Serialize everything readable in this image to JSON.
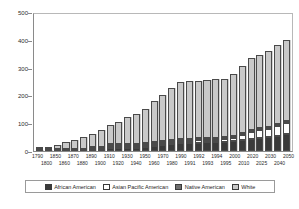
{
  "chart_data": {
    "type": "bar",
    "stacked": true,
    "title": "",
    "subtitle": "",
    "xlabel": "",
    "ylabel": "",
    "ylim": [
      0,
      500
    ],
    "yticks": [
      0,
      100,
      200,
      300,
      400,
      500
    ],
    "ytick_labels": [
      "0",
      "100",
      "200",
      "300",
      "400",
      "500"
    ],
    "grid": false,
    "legend_position": "bottom",
    "categories": [
      "1790",
      "1800",
      "1850",
      "1860",
      "1870",
      "1880",
      "1890",
      "1900",
      "1910",
      "1920",
      "1930",
      "1940",
      "1950",
      "1960",
      "1970",
      "1980",
      "1990",
      "1991",
      "1992",
      "1993",
      "1994",
      "1995",
      "2000",
      "2010",
      "2020",
      "2025",
      "2030",
      "2040",
      "2050"
    ],
    "series": [
      {
        "name": "White",
        "color": "#c9c9c9",
        "values": [
          3.2,
          4.3,
          19.6,
          26.9,
          33.6,
          43.4,
          55.1,
          66.8,
          81.7,
          94.8,
          110.3,
          118.2,
          135.1,
          158.8,
          178.1,
          194.7,
          208.7,
          210.0,
          211.4,
          212.8,
          214.1,
          215.5,
          225.5,
          244.0,
          261.0,
          268.0,
          275.0,
          288.0,
          294.0
        ]
      },
      {
        "name": "African American",
        "color": "#3a3a3a",
        "values": [
          0.76,
          1.0,
          3.6,
          4.4,
          4.9,
          6.6,
          7.5,
          8.8,
          9.8,
          10.5,
          11.9,
          12.9,
          15.0,
          18.9,
          22.6,
          26.5,
          30.0,
          30.5,
          31.0,
          31.5,
          32.0,
          32.6,
          35.5,
          40.5,
          45.4,
          47.8,
          50.0,
          55.0,
          60.0
        ]
      },
      {
        "name": "Asian Pacific American",
        "color": "#ffffff",
        "values": [
          0.0,
          0.0,
          0.0,
          0.04,
          0.06,
          0.1,
          0.1,
          0.1,
          0.2,
          0.2,
          0.3,
          0.3,
          0.4,
          0.9,
          1.4,
          3.5,
          7.3,
          7.8,
          8.3,
          8.8,
          9.3,
          9.8,
          12.5,
          18.0,
          24.0,
          27.0,
          30.0,
          36.0,
          41.0
        ]
      },
      {
        "name": "Native American",
        "color": "#6e6e6e",
        "values": [
          0.0,
          0.0,
          0.0,
          0.0,
          0.03,
          0.07,
          0.25,
          0.24,
          0.27,
          0.24,
          0.33,
          0.33,
          0.34,
          0.52,
          0.8,
          1.4,
          2.0,
          2.05,
          2.1,
          2.15,
          2.2,
          2.25,
          2.4,
          2.8,
          3.2,
          3.4,
          3.6,
          4.0,
          4.4
        ]
      }
    ]
  },
  "legend": {
    "items": [
      {
        "label": "African American",
        "swatch": "#3a3a3a"
      },
      {
        "label": "Asian Pacific American",
        "swatch": "#ffffff"
      },
      {
        "label": "Native American",
        "swatch": "#6e6e6e"
      },
      {
        "label": "White",
        "swatch": "#c9c9c9"
      }
    ]
  }
}
